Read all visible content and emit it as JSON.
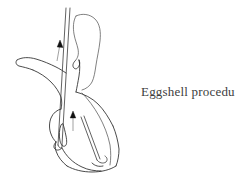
{
  "figure": {
    "background_color": "#ffffff",
    "width": 235,
    "height": 184,
    "caption": "Eggshell procedure",
    "caption_color": "#3d3d3d",
    "line_color": "#2b2b2b",
    "arrow_color": "#111111",
    "illustration_type": "anatomical line drawing",
    "arrows": [
      {
        "label": "upper-direction-arrow",
        "direction": "up"
      },
      {
        "label": "lower-direction-arrow",
        "direction": "up"
      }
    ],
    "instruments": [
      {
        "label": "vertical-cannula",
        "orientation": "vertical"
      },
      {
        "label": "diagonal-probe",
        "orientation": "diagonal"
      }
    ]
  }
}
